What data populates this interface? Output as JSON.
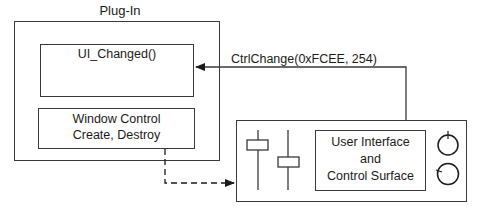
{
  "diagram": {
    "plugin": {
      "title": "Plug-In",
      "ui_changed_box": {
        "label": "UI_Changed()"
      },
      "window_control_box": {
        "line1": "Window Control",
        "line2": "Create, Destroy"
      }
    },
    "control_surface": {
      "inner_box": {
        "line1": "User Interface",
        "line2": "and",
        "line3": "Control Surface"
      },
      "sliders": [
        {
          "name": "slider-1",
          "position": "high"
        },
        {
          "name": "slider-2",
          "position": "mid"
        }
      ],
      "knobs": [
        {
          "name": "knob-1",
          "indicator": "top"
        },
        {
          "name": "knob-2",
          "indicator": "left"
        }
      ]
    },
    "connections": [
      {
        "from": "control_surface",
        "to": "ui_changed_box",
        "label": "CtrlChange(0xFCEE, 254)",
        "style": "solid"
      },
      {
        "from": "window_control_box",
        "to": "control_surface",
        "label": "",
        "style": "dashed"
      }
    ],
    "colors": {
      "line": "#3a3a3a",
      "background": "#ffffff",
      "text": "#1a1a1a"
    }
  }
}
